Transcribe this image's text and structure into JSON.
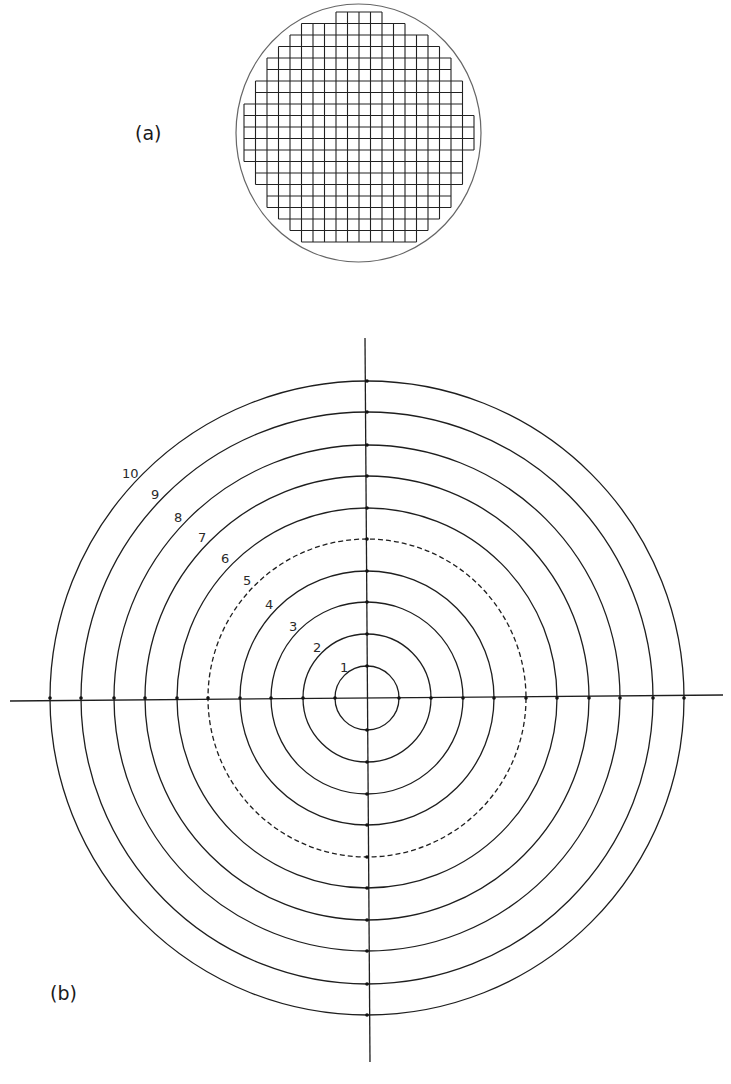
{
  "panel_a": {
    "label": "(a)",
    "description": "Circular reticle with square grid",
    "circle": {
      "cx": 358.5,
      "cy": 133,
      "rx": 122.5,
      "ry": 129
    },
    "grid": {
      "x0": 244,
      "y0": 12,
      "pitch": 11.5,
      "count": 21
    }
  },
  "panel_b": {
    "label": "(b)",
    "description": "Concentric ring reticle with crosshair",
    "center": {
      "x": 367,
      "y": 698
    },
    "rings": [
      {
        "label": "1",
        "r": 32,
        "dashed": false,
        "lx": 340,
        "ly": 672
      },
      {
        "label": "2",
        "r": 64,
        "dashed": false,
        "lx": 313,
        "ly": 652
      },
      {
        "label": "3",
        "r": 96,
        "dashed": false,
        "lx": 289,
        "ly": 631
      },
      {
        "label": "4",
        "r": 127,
        "dashed": false,
        "lx": 265,
        "ly": 609
      },
      {
        "label": "5",
        "r": 159,
        "dashed": true,
        "lx": 243,
        "ly": 585
      },
      {
        "label": "6",
        "r": 190,
        "dashed": false,
        "lx": 221,
        "ly": 563
      },
      {
        "label": "7",
        "r": 222,
        "dashed": false,
        "lx": 198,
        "ly": 542
      },
      {
        "label": "8",
        "r": 253,
        "dashed": false,
        "lx": 174,
        "ly": 522
      },
      {
        "label": "9",
        "r": 286,
        "dashed": false,
        "lx": 151,
        "ly": 499
      },
      {
        "label": "10",
        "r": 317,
        "dashed": false,
        "lx": 122,
        "ly": 478
      }
    ],
    "crosshair": {
      "h": {
        "x1": 10,
        "y1": 701,
        "x2": 723,
        "y2": 695
      },
      "v": {
        "x1": 365,
        "y1": 338,
        "x2": 370,
        "y2": 1062
      }
    }
  },
  "colors": {
    "line": "#1e1e1e",
    "outline": "#555555",
    "background": "#ffffff"
  }
}
